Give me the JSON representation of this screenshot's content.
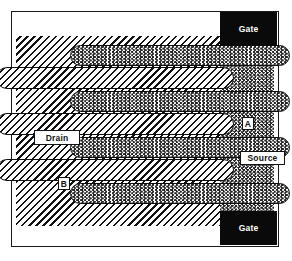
{
  "figure": {
    "kind": "semiconductor-layout-diagram",
    "width": 292,
    "height": 261
  },
  "colors": {
    "frame": "#1a1a1a",
    "gate_fill": "#0a0a0a",
    "gate_text": "#ffffff",
    "outline": "#0d0d0d",
    "background": "#ffffff",
    "hatch_ink": "#111111",
    "wave_ink": "#222222"
  },
  "regions": {
    "drain": {
      "name": "drain",
      "fill": "diagonal-hatch",
      "label": "Drain"
    },
    "source": {
      "name": "source",
      "fill": "wavy-zigzag",
      "label": "Source"
    }
  },
  "gates": [
    {
      "label": "Gate",
      "position": "top-right",
      "fill": "solid-black"
    },
    {
      "label": "Gate",
      "position": "bottom-right",
      "fill": "solid-black"
    }
  ],
  "callouts": [
    {
      "id": "a",
      "label": "A",
      "points_to": "source-region"
    },
    {
      "id": "b",
      "label": "B",
      "points_to": "drain-region"
    }
  ],
  "fingers": {
    "source_fingers": [
      {
        "index": 0,
        "fill": "wavy-zigzag",
        "rounded_end": "left"
      },
      {
        "index": 1,
        "fill": "wavy-zigzag",
        "rounded_end": "left"
      },
      {
        "index": 2,
        "fill": "wavy-zigzag",
        "rounded_end": "left"
      },
      {
        "index": 3,
        "fill": "wavy-zigzag",
        "rounded_end": "left"
      }
    ],
    "drain_fingers": [
      {
        "index": 0,
        "fill": "diagonal-hatch",
        "rounded_end": "right"
      },
      {
        "index": 1,
        "fill": "diagonal-hatch",
        "rounded_end": "right"
      },
      {
        "index": 2,
        "fill": "diagonal-hatch",
        "rounded_end": "right"
      }
    ]
  }
}
